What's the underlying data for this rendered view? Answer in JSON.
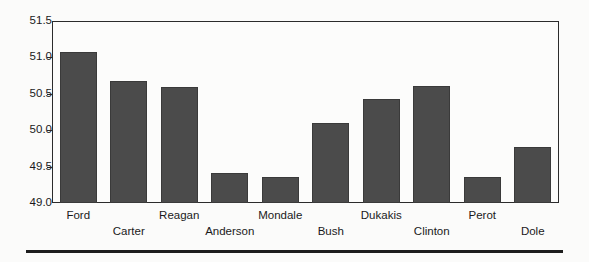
{
  "chart_data": {
    "type": "bar",
    "title": "",
    "subtitle": "",
    "xlabel": "",
    "ylabel": "",
    "categories": [
      "Ford",
      "Carter",
      "Reagan",
      "Anderson",
      "Mondale",
      "Bush",
      "Dukakis",
      "Clinton",
      "Perot",
      "Dole"
    ],
    "values": [
      51.09,
      50.69,
      50.6,
      49.42,
      49.36,
      50.1,
      50.43,
      50.61,
      49.36,
      49.77
    ],
    "ylim": [
      49.0,
      51.5
    ],
    "yticks": [
      "49.0",
      "49.5",
      "50.0",
      "50.5",
      "51.0",
      "51.5"
    ],
    "ytick_values": [
      49.0,
      49.5,
      50.0,
      50.5,
      51.0,
      51.5
    ],
    "grid": false,
    "legend": null,
    "bar_color": "#4b4b4b",
    "axis_color": "#2b2b2b",
    "label_rows": [
      0,
      1,
      0,
      1,
      0,
      1,
      0,
      1,
      0,
      1
    ]
  },
  "figure": {
    "background": "#fbfbfa",
    "plot_background": "#fcfcfb",
    "bottom_rule_color": "#1d1d1d"
  }
}
